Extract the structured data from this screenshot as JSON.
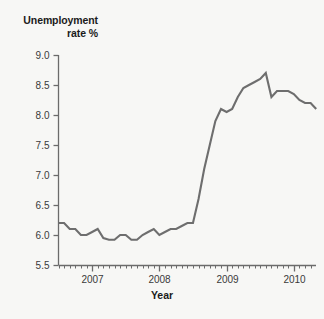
{
  "chart_data": {
    "type": "line",
    "title": "",
    "ylabel": "Unemployment\nrate %",
    "xlabel": "Year",
    "ylim": [
      5.5,
      9.0
    ],
    "ytick_labels": [
      "9.0",
      "8.5",
      "8.0",
      "7.5",
      "7.0",
      "6.5",
      "6.0",
      "5.5"
    ],
    "ytick_values": [
      9.0,
      8.5,
      8.0,
      7.5,
      7.0,
      6.5,
      6.0,
      5.5
    ],
    "xtick_labels": [
      "2007",
      "2008",
      "2009",
      "2010"
    ],
    "xtick_values": [
      2007.0,
      2008.0,
      2009.0,
      2010.0
    ],
    "xlim": [
      2006.5,
      2010.33
    ],
    "grid": false,
    "legend": null,
    "line_color": "#6e6e6e",
    "axis_color": "#6b6b6b",
    "background_color": "#f7f7f5",
    "minor_tick_interval_months": 1,
    "series": [
      {
        "name": "Unemployment rate %",
        "x": [
          2006.5,
          2006.583,
          2006.667,
          2006.75,
          2006.833,
          2006.917,
          2007.0,
          2007.083,
          2007.167,
          2007.25,
          2007.333,
          2007.417,
          2007.5,
          2007.583,
          2007.667,
          2007.75,
          2007.833,
          2007.917,
          2008.0,
          2008.083,
          2008.167,
          2008.25,
          2008.333,
          2008.417,
          2008.5,
          2008.583,
          2008.667,
          2008.75,
          2008.833,
          2008.917,
          2009.0,
          2009.083,
          2009.167,
          2009.25,
          2009.333,
          2009.417,
          2009.5,
          2009.583,
          2009.667,
          2009.75,
          2009.833,
          2009.917,
          2010.0,
          2010.083,
          2010.167,
          2010.25,
          2010.333
        ],
        "values": [
          6.2,
          6.2,
          6.1,
          6.1,
          6.0,
          6.0,
          6.05,
          6.1,
          5.95,
          5.92,
          5.92,
          6.0,
          6.0,
          5.92,
          5.92,
          6.0,
          6.05,
          6.1,
          6.0,
          6.05,
          6.1,
          6.1,
          6.15,
          6.2,
          6.2,
          6.6,
          7.1,
          7.5,
          7.9,
          8.1,
          8.05,
          8.1,
          8.3,
          8.45,
          8.5,
          8.55,
          8.6,
          8.7,
          8.3,
          8.4,
          8.4,
          8.4,
          8.35,
          8.25,
          8.2,
          8.2,
          8.1
        ]
      }
    ],
    "annotations": []
  }
}
